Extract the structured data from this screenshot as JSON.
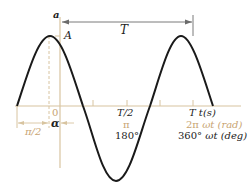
{
  "figure": {
    "type": "sinusoid-phase-diagram",
    "colors": {
      "curve": "#1a1a1a",
      "axis": "#d8c4a0",
      "dimension_line": "#6b6b6b",
      "label_dark": "#222222",
      "label_tan": "#c8a472"
    }
  },
  "labels": {
    "vertical_axis": "a",
    "amplitude": "A",
    "period": "T",
    "origin": "0",
    "phase_offset_quarter": "π/2",
    "phase_angle": "α",
    "half_period_time": "T/2",
    "half_period_rad": "π",
    "half_period_deg": "180°",
    "full_period_time": "T",
    "time_unit": "t(s)",
    "full_period_rad": "2π",
    "rad_unit": "ωt (rad)",
    "full_period_deg": "360°",
    "deg_unit": "ωt (deg)"
  },
  "curve": {
    "function": "a = A sin(ωt + α)",
    "zero_crossings_px": [
      17,
      83,
      150,
      213
    ],
    "peak_px": [
      49,
      36
    ],
    "trough_px": [
      115,
      181
    ]
  }
}
